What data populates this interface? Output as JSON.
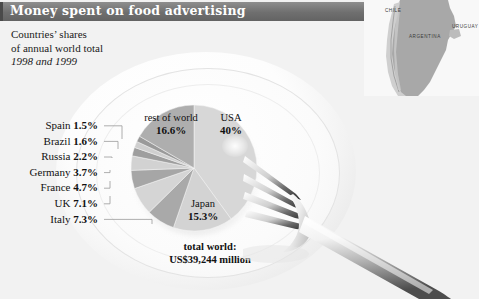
{
  "header": {
    "title": "Money spent on food advertising"
  },
  "subtitle": {
    "line1": "Countries’ shares",
    "line2": "of annual world total",
    "line3": "1998 and 1999"
  },
  "total": {
    "line1": "total world:",
    "line2": "US$39,244 million"
  },
  "legend": [
    {
      "country": "Spain",
      "value": "1.5%"
    },
    {
      "country": "Brazil",
      "value": "1.6%"
    },
    {
      "country": "Russia",
      "value": "2.2%"
    },
    {
      "country": "Germany",
      "value": "3.7%"
    },
    {
      "country": "France",
      "value": "4.7%"
    },
    {
      "country": "UK",
      "value": "7.1%"
    },
    {
      "country": "Italy",
      "value": "7.3%"
    }
  ],
  "pie_labels": {
    "usa_name": "USA",
    "usa_value": "40%",
    "row_name": "rest of world",
    "row_value": "16.6%",
    "japan_name": "Japan",
    "japan_value": "15.3%"
  },
  "map": {
    "chile": "CHILE",
    "argentina": "ARGENTINA",
    "uruguay": "URUGUAY"
  },
  "colors": {
    "header_bar": "#6f6f6f",
    "header_text": "#ffffff",
    "background": "#f2f2f2",
    "slice_light": "#d7d7d7",
    "slice_medium": "#a9a9a9",
    "slice_dark": "#949494",
    "leader_line": "#9a9a9a",
    "map_land": "#a8a8a8"
  },
  "chart_data": {
    "type": "pie",
    "title": "Money spent on food advertising",
    "subtitle": "Countries’ shares of annual world total, 1998 and 1999",
    "unit": "percent of annual world total",
    "total_label": "total world: US$39,244 million",
    "total_value": 39244,
    "total_unit": "US$ million",
    "start_angle_deg": 0,
    "direction": "clockwise",
    "legend_position": "left",
    "grid": false,
    "categories": [
      "USA",
      "Japan",
      "Italy",
      "UK",
      "France",
      "Germany",
      "Russia",
      "Brazil",
      "Spain",
      "rest of world"
    ],
    "values": [
      40.0,
      15.3,
      7.3,
      7.1,
      4.7,
      3.7,
      2.2,
      1.6,
      1.5,
      16.6
    ],
    "labels": [
      "40%",
      "15.3%",
      "7.3%",
      "7.1%",
      "4.7%",
      "3.7%",
      "2.2%",
      "1.6%",
      "1.5%",
      "16.6%"
    ],
    "slice_colors": [
      "#d7d7d7",
      "#d3d3d3",
      "#a9a9a9",
      "#d5d5d5",
      "#a6a6a6",
      "#d2d2d2",
      "#9e9e9e",
      "#cfcfcf",
      "#9a9a9a",
      "#aeaeae"
    ]
  }
}
